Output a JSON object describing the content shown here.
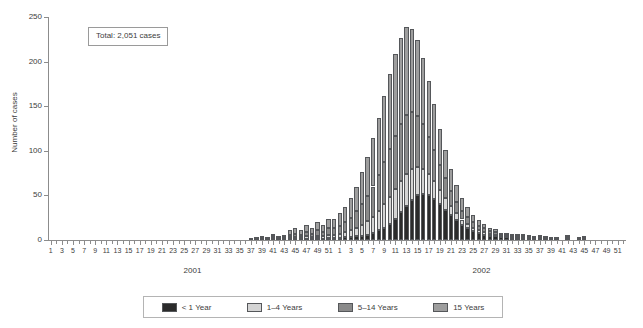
{
  "chart_data": {
    "type": "bar",
    "stacked": true,
    "title": "",
    "xlabel": "",
    "ylabel": "Number of cases",
    "ylim": [
      0,
      250
    ],
    "yticks": [
      0,
      50,
      100,
      150,
      200,
      250
    ],
    "grid": false,
    "legend_position": "bottom",
    "annotation": "Total: 2,051 cases",
    "year_labels": [
      "2001",
      "2002"
    ],
    "xtick_labels": [
      1,
      3,
      5,
      7,
      9,
      11,
      13,
      15,
      17,
      19,
      21,
      23,
      25,
      27,
      29,
      31,
      33,
      35,
      37,
      39,
      41,
      43,
      45,
      47,
      49,
      51
    ],
    "x": [
      "2001-W1",
      "2001-W2",
      "2001-W3",
      "2001-W4",
      "2001-W5",
      "2001-W6",
      "2001-W7",
      "2001-W8",
      "2001-W9",
      "2001-W10",
      "2001-W11",
      "2001-W12",
      "2001-W13",
      "2001-W14",
      "2001-W15",
      "2001-W16",
      "2001-W17",
      "2001-W18",
      "2001-W19",
      "2001-W20",
      "2001-W21",
      "2001-W22",
      "2001-W23",
      "2001-W24",
      "2001-W25",
      "2001-W26",
      "2001-W27",
      "2001-W28",
      "2001-W29",
      "2001-W30",
      "2001-W31",
      "2001-W32",
      "2001-W33",
      "2001-W34",
      "2001-W35",
      "2001-W36",
      "2001-W37",
      "2001-W38",
      "2001-W39",
      "2001-W40",
      "2001-W41",
      "2001-W42",
      "2001-W43",
      "2001-W44",
      "2001-W45",
      "2001-W46",
      "2001-W47",
      "2001-W48",
      "2001-W49",
      "2001-W50",
      "2001-W51",
      "2001-W52",
      "2002-W1",
      "2002-W2",
      "2002-W3",
      "2002-W4",
      "2002-W5",
      "2002-W6",
      "2002-W7",
      "2002-W8",
      "2002-W9",
      "2002-W10",
      "2002-W11",
      "2002-W12",
      "2002-W13",
      "2002-W14",
      "2002-W15",
      "2002-W16",
      "2002-W17",
      "2002-W18",
      "2002-W19",
      "2002-W20",
      "2002-W21",
      "2002-W22",
      "2002-W23",
      "2002-W24",
      "2002-W25",
      "2002-W26",
      "2002-W27",
      "2002-W28",
      "2002-W29",
      "2002-W30",
      "2002-W31",
      "2002-W32",
      "2002-W33",
      "2002-W34",
      "2002-W35",
      "2002-W36",
      "2002-W37",
      "2002-W38",
      "2002-W39",
      "2002-W40",
      "2002-W41",
      "2002-W42",
      "2002-W43",
      "2002-W44",
      "2002-W45",
      "2002-W46",
      "2002-W47",
      "2002-W48",
      "2002-W49",
      "2002-W50",
      "2002-W51",
      "2002-W52"
    ],
    "series": [
      {
        "name": "< 1 Year",
        "color": "#2b2b2b",
        "values": [
          0,
          0,
          0,
          0,
          0,
          0,
          0,
          0,
          0,
          0,
          0,
          0,
          0,
          0,
          0,
          0,
          0,
          0,
          0,
          0,
          0,
          0,
          0,
          0,
          0,
          0,
          0,
          0,
          0,
          0,
          0,
          0,
          0,
          0,
          0,
          0,
          0,
          0,
          0,
          0,
          1,
          0,
          0,
          1,
          1,
          1,
          1,
          1,
          2,
          1,
          2,
          2,
          2,
          3,
          3,
          4,
          5,
          6,
          8,
          11,
          14,
          18,
          24,
          31,
          38,
          45,
          50,
          52,
          50,
          46,
          40,
          34,
          28,
          22,
          17,
          13,
          10,
          8,
          6,
          5,
          4,
          3,
          3,
          2,
          2,
          2,
          1,
          1,
          1,
          1,
          1,
          0,
          0,
          1,
          0,
          0,
          1,
          0,
          0,
          0,
          0,
          0,
          0,
          0
        ]
      },
      {
        "name": "1–4 Years",
        "color": "#d4d4d4",
        "values": [
          0,
          0,
          0,
          0,
          0,
          0,
          0,
          0,
          0,
          0,
          0,
          0,
          0,
          0,
          0,
          0,
          0,
          0,
          0,
          0,
          0,
          0,
          0,
          0,
          0,
          0,
          0,
          0,
          0,
          0,
          0,
          0,
          0,
          0,
          0,
          0,
          0,
          0,
          1,
          0,
          1,
          1,
          1,
          2,
          2,
          2,
          3,
          2,
          3,
          3,
          4,
          4,
          5,
          6,
          8,
          10,
          12,
          15,
          18,
          22,
          26,
          30,
          33,
          35,
          36,
          35,
          32,
          28,
          24,
          20,
          16,
          13,
          10,
          8,
          6,
          5,
          4,
          3,
          3,
          2,
          2,
          1,
          1,
          1,
          1,
          1,
          1,
          0,
          1,
          0,
          0,
          0,
          0,
          1,
          0,
          0,
          0,
          0,
          0,
          0,
          0,
          0,
          0,
          0
        ]
      },
      {
        "name": "5–14 Years",
        "color": "#8a8a8a",
        "values": [
          0,
          0,
          0,
          0,
          0,
          0,
          0,
          0,
          0,
          0,
          0,
          0,
          0,
          0,
          0,
          0,
          0,
          0,
          0,
          0,
          0,
          0,
          0,
          0,
          0,
          0,
          0,
          0,
          0,
          0,
          0,
          0,
          0,
          0,
          0,
          0,
          0,
          1,
          1,
          1,
          2,
          1,
          2,
          3,
          4,
          3,
          5,
          4,
          6,
          5,
          7,
          7,
          9,
          11,
          14,
          18,
          23,
          28,
          34,
          40,
          47,
          54,
          60,
          64,
          66,
          63,
          57,
          50,
          42,
          35,
          28,
          22,
          17,
          13,
          10,
          8,
          6,
          5,
          4,
          3,
          3,
          2,
          2,
          2,
          1,
          1,
          1,
          1,
          1,
          1,
          0,
          1,
          0,
          1,
          0,
          1,
          1,
          0,
          0,
          0,
          0,
          0,
          0,
          0
        ]
      },
      {
        "name": "15 Years",
        "color": "#9e9e9e",
        "values": [
          0,
          0,
          0,
          0,
          0,
          0,
          0,
          0,
          0,
          0,
          0,
          0,
          0,
          0,
          0,
          0,
          0,
          0,
          0,
          0,
          0,
          0,
          0,
          0,
          0,
          0,
          0,
          0,
          0,
          0,
          0,
          0,
          0,
          0,
          0,
          0,
          1,
          1,
          2,
          1,
          3,
          2,
          3,
          5,
          6,
          5,
          8,
          7,
          9,
          8,
          11,
          11,
          14,
          17,
          22,
          28,
          36,
          44,
          54,
          64,
          75,
          84,
          92,
          97,
          99,
          94,
          85,
          74,
          62,
          51,
          41,
          32,
          25,
          19,
          14,
          11,
          8,
          6,
          5,
          4,
          3,
          2,
          2,
          2,
          1,
          1,
          1,
          1,
          1,
          1,
          1,
          1,
          0,
          2,
          0,
          1,
          2,
          0,
          0,
          0,
          0,
          0,
          0,
          0
        ]
      }
    ]
  },
  "legend": {
    "items": [
      {
        "label": "< 1 Year",
        "color": "#2b2b2b"
      },
      {
        "label": "1–4 Years",
        "color": "#d4d4d4"
      },
      {
        "label": "5–14 Years",
        "color": "#8a8a8a"
      },
      {
        "label": "15 Years",
        "color": "#9e9e9e"
      }
    ]
  }
}
